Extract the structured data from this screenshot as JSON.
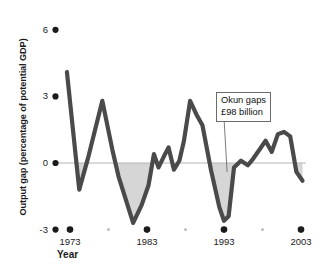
{
  "chart_data": {
    "type": "line",
    "title": "",
    "subtitle": "",
    "xlabel": "Year",
    "ylabel": "Output gap (percentage of potential GDP)",
    "xlim": [
      1972,
      2004
    ],
    "ylim": [
      -3,
      6
    ],
    "yticks": [
      6,
      3,
      0,
      -3
    ],
    "ytick_labels": [
      "6",
      "3",
      "0",
      "-3"
    ],
    "xticks": [
      1973,
      1983,
      1993,
      2003
    ],
    "xtick_labels": [
      "1973",
      "1983",
      "1993",
      "2003"
    ],
    "minor_xticks": [
      1978,
      1988,
      1998
    ],
    "grid": false,
    "legend": null,
    "zero_line": 0,
    "series": [
      {
        "name": "Output gap",
        "color": "#4a4a4a",
        "x": [
          1972.6,
          1974.2,
          1975.4,
          1977.2,
          1978.5,
          1979.3,
          1981.2,
          1982.3,
          1983.2,
          1983.9,
          1984.5,
          1985.2,
          1985.8,
          1986.5,
          1987.2,
          1987.8,
          1988.6,
          1989.4,
          1990.2,
          1991.3,
          1992.4,
          1993.0,
          1993.6,
          1994.3,
          1995.2,
          1996.1,
          1996.8,
          1997.6,
          1998.4,
          1999.2,
          2000.0,
          2000.8,
          2001.6,
          2002.4,
          2003.2
        ],
        "y": [
          4.1,
          -1.2,
          0.3,
          2.8,
          0.6,
          -0.6,
          -2.7,
          -1.9,
          -1.0,
          0.4,
          -0.2,
          0.3,
          0.7,
          -0.3,
          0.1,
          1.0,
          2.8,
          2.2,
          1.7,
          -0.3,
          -2.0,
          -2.6,
          -2.4,
          -0.2,
          0.1,
          -0.1,
          0.2,
          0.6,
          1.0,
          0.5,
          1.3,
          1.4,
          1.2,
          -0.4,
          -0.8
        ]
      }
    ],
    "shaded_region": {
      "label": "negative output gap fill",
      "color": "#d6d6d6",
      "description": "area between curve and zero line where output gap is below zero"
    },
    "annotations": [
      {
        "name": "okun-gaps-callout",
        "line1": "Okun gaps",
        "line2": "£98 billion",
        "points_to_x": 1993.4,
        "points_to_y": -0.4
      }
    ]
  },
  "axis": {
    "y_title": "Output gap (percentage of potential GDP)",
    "x_title": "Year"
  },
  "callout": {
    "line1": "Okun gaps",
    "line2": "£98 billion"
  },
  "colors": {
    "line": "#4a4a4a",
    "fill": "#d6d6d6",
    "tick_dot": "#1b1b1b",
    "minor_dot": "#bdbdbd",
    "zero_line": "#b5b5b5",
    "text": "#1b1b1b"
  }
}
